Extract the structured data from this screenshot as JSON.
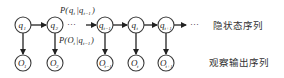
{
  "diagram": {
    "type": "hidden-markov-model",
    "hidden_nodes": [
      {
        "id": "q1",
        "base": "q",
        "sub": "1"
      },
      {
        "id": "q2",
        "base": "q",
        "sub": "2"
      },
      {
        "id": "q_t-1",
        "base": "q",
        "sub": "t−1"
      },
      {
        "id": "q_t",
        "base": "q",
        "sub": "t"
      },
      {
        "id": "q_t+1",
        "base": "q",
        "sub": "t+1"
      }
    ],
    "observed_nodes": [
      {
        "id": "O1",
        "base": "O",
        "sub": "1"
      },
      {
        "id": "O2",
        "base": "O",
        "sub": "2"
      },
      {
        "id": "O_t-1",
        "base": "O",
        "sub": "t−1"
      },
      {
        "id": "O_t",
        "base": "O",
        "sub": "t"
      },
      {
        "id": "O_t+1",
        "base": "O",
        "sub": "t+1"
      }
    ],
    "ellipsis": "···",
    "transition_label": "P(q_t|q_{t−1})",
    "transition_label_parts": {
      "p": "P(",
      "q": "q",
      "qsub": "t",
      "bar": "|",
      "q2": "q",
      "q2sub": "t−1",
      "close": ")"
    },
    "emission_label_parts": {
      "p": "P(",
      "o": "O",
      "osub": "t",
      "bar": "|",
      "q2": "q",
      "q2sub": "t−1",
      "close": ")"
    },
    "hidden_sequence_label": "隐状态序列",
    "observed_sequence_label": "观察输出序列"
  }
}
